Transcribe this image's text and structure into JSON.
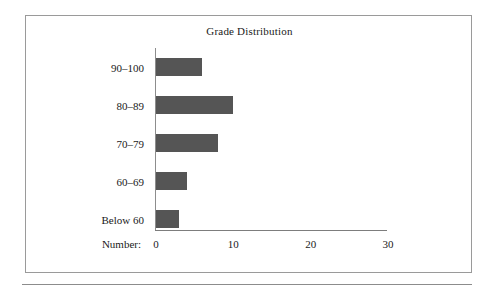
{
  "figure": {
    "title": "Grade Distribution"
  },
  "chart_data": {
    "type": "bar",
    "orientation": "horizontal",
    "title": "Grade Distribution",
    "xlabel": "Number:",
    "ylabel": "",
    "categories": [
      "90–100",
      "80–89",
      "70–79",
      "60–69",
      "Below 60"
    ],
    "values": [
      6,
      10,
      8,
      4,
      3
    ],
    "xlim": [
      0,
      30
    ],
    "xticks": [
      0,
      10,
      20,
      30
    ],
    "xtick_labels": [
      "0",
      "10",
      "20",
      "30"
    ],
    "grid": false,
    "legend": false,
    "bar_color": "#555555",
    "axis_color": "#8d8d8d",
    "frame_color": "#9a9a9a",
    "background": "#ffffff"
  }
}
